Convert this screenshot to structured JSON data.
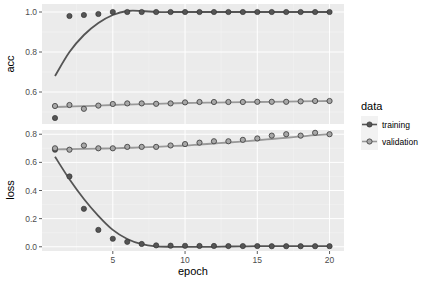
{
  "chart_data": {
    "type": "line",
    "title": "",
    "xlabel": "epoch",
    "x": [
      1,
      2,
      3,
      4,
      5,
      6,
      7,
      8,
      9,
      10,
      11,
      12,
      13,
      14,
      15,
      16,
      17,
      18,
      19,
      20
    ],
    "xlim": [
      0.1,
      21
    ],
    "xticks": [
      5,
      10,
      15,
      20
    ],
    "grid": true,
    "legend": {
      "title": "data",
      "position": "right",
      "entries": [
        {
          "name": "training",
          "color": "#555555",
          "fill": "#555555"
        },
        {
          "name": "validation",
          "color": "#888888",
          "fill": "#a8a8a8"
        }
      ]
    },
    "panels": [
      {
        "ylabel": "acc",
        "ylim": [
          0.44,
          1.04
        ],
        "yticks": [
          0.6,
          0.8,
          1.0
        ],
        "ytick_labels": [
          "0.6",
          "0.8",
          "1.0"
        ],
        "series": [
          {
            "name": "training",
            "values": [
              0.47,
              0.98,
              0.985,
              0.99,
              1.0,
              1.0,
              1.0,
              1.0,
              1.0,
              1.0,
              1.0,
              1.0,
              1.0,
              1.0,
              1.0,
              1.0,
              1.0,
              1.0,
              1.0,
              1.0
            ],
            "smooth": [
              0.68,
              0.8,
              0.885,
              0.945,
              0.985,
              1.005,
              1.005,
              1.0,
              1.0,
              1.0,
              1.0,
              1.0,
              1.0,
              1.0,
              1.0,
              1.0,
              1.0,
              1.0,
              1.0,
              1.0
            ]
          },
          {
            "name": "validation",
            "values": [
              0.53,
              0.535,
              0.516,
              0.532,
              0.54,
              0.543,
              0.543,
              0.541,
              0.543,
              0.548,
              0.55,
              0.55,
              0.55,
              0.55,
              0.551,
              0.551,
              0.551,
              0.553,
              0.555,
              0.555
            ],
            "smooth": [
              0.525,
              0.527,
              0.529,
              0.532,
              0.535,
              0.537,
              0.539,
              0.541,
              0.543,
              0.545,
              0.546,
              0.547,
              0.548,
              0.549,
              0.55,
              0.551,
              0.552,
              0.553,
              0.554,
              0.555
            ]
          }
        ]
      },
      {
        "ylabel": "loss",
        "ylim": [
          -0.03,
          0.83
        ],
        "yticks": [
          0.0,
          0.2,
          0.4,
          0.6,
          0.8
        ],
        "ytick_labels": [
          "0.0",
          "0.2",
          "0.4",
          "0.6",
          "0.8"
        ],
        "series": [
          {
            "name": "training",
            "values": [
              0.69,
              0.5,
              0.27,
              0.12,
              0.057,
              0.035,
              0.02,
              0.01,
              0.008,
              0.007,
              0.006,
              0.006,
              0.005,
              0.005,
              0.005,
              0.004,
              0.004,
              0.004,
              0.004,
              0.004
            ],
            "smooth": [
              0.64,
              0.48,
              0.34,
              0.22,
              0.12,
              0.055,
              0.018,
              0.003,
              0.0,
              0.0,
              0.0,
              0.0,
              0.002,
              0.003,
              0.004,
              0.004,
              0.004,
              0.004,
              0.004,
              0.004
            ]
          },
          {
            "name": "validation",
            "values": [
              0.7,
              0.69,
              0.72,
              0.7,
              0.7,
              0.71,
              0.71,
              0.71,
              0.72,
              0.73,
              0.74,
              0.75,
              0.75,
              0.76,
              0.77,
              0.79,
              0.8,
              0.79,
              0.81,
              0.8
            ],
            "smooth": [
              0.692,
              0.694,
              0.696,
              0.698,
              0.7,
              0.703,
              0.706,
              0.71,
              0.715,
              0.72,
              0.727,
              0.734,
              0.741,
              0.749,
              0.757,
              0.766,
              0.775,
              0.784,
              0.793,
              0.8
            ]
          }
        ]
      }
    ]
  },
  "labels": {
    "panel_top_ylabel": "acc",
    "panel_bottom_ylabel": "loss",
    "xlabel": "epoch",
    "legend_title": "data",
    "legend_training": "training",
    "legend_validation": "validation"
  }
}
